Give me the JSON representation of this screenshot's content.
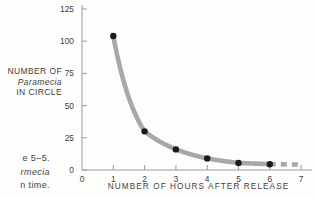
{
  "figure": {
    "caption_lines": [
      "e 5–5.",
      "rmecia",
      "n time."
    ],
    "caption_italic_index": 1
  },
  "axis_title": {
    "y_line1": "NUMBER OF",
    "y_line2": "Paramecia",
    "y_line3": "IN CIRCLE",
    "x": "NUMBER OF HOURS AFTER RELEASE"
  },
  "chart_data": {
    "type": "line",
    "title": "",
    "xlabel": "NUMBER OF HOURS AFTER RELEASE",
    "ylabel": "NUMBER OF Paramecia IN CIRCLE",
    "x": [
      1,
      2,
      3,
      4,
      5,
      6
    ],
    "values": [
      104,
      30,
      16,
      9,
      5.5,
      4.5
    ],
    "series": [
      {
        "name": "Paramecia in circle",
        "x": [
          1,
          2,
          3,
          4,
          5,
          6
        ],
        "values": [
          104,
          30,
          16,
          9,
          5.5,
          4.5
        ],
        "line_color": "#a8a8a8",
        "marker_color": "#1a1a1a",
        "marker": "circle"
      }
    ],
    "extrapolation": {
      "style": "dashed",
      "x_from": 6,
      "x_to": 7,
      "y_from": 4.5,
      "y_to": 4.2,
      "color": "#a8a8a8"
    },
    "xlim": [
      0,
      7.35
    ],
    "ylim": [
      0,
      128
    ],
    "xticks": [
      0,
      1,
      2,
      3,
      4,
      5,
      6,
      7
    ],
    "xticklabels": [
      "0",
      "1",
      "2",
      "3",
      "4",
      "5",
      "6",
      "7"
    ],
    "yticks": [
      0,
      25,
      50,
      75,
      100,
      125
    ],
    "yticklabels": [
      "0",
      "25",
      "50",
      "75",
      "100",
      "125"
    ],
    "grid": false,
    "legend": "none",
    "axis_color": "#9a9a9a",
    "background": "#fdfdfb"
  }
}
